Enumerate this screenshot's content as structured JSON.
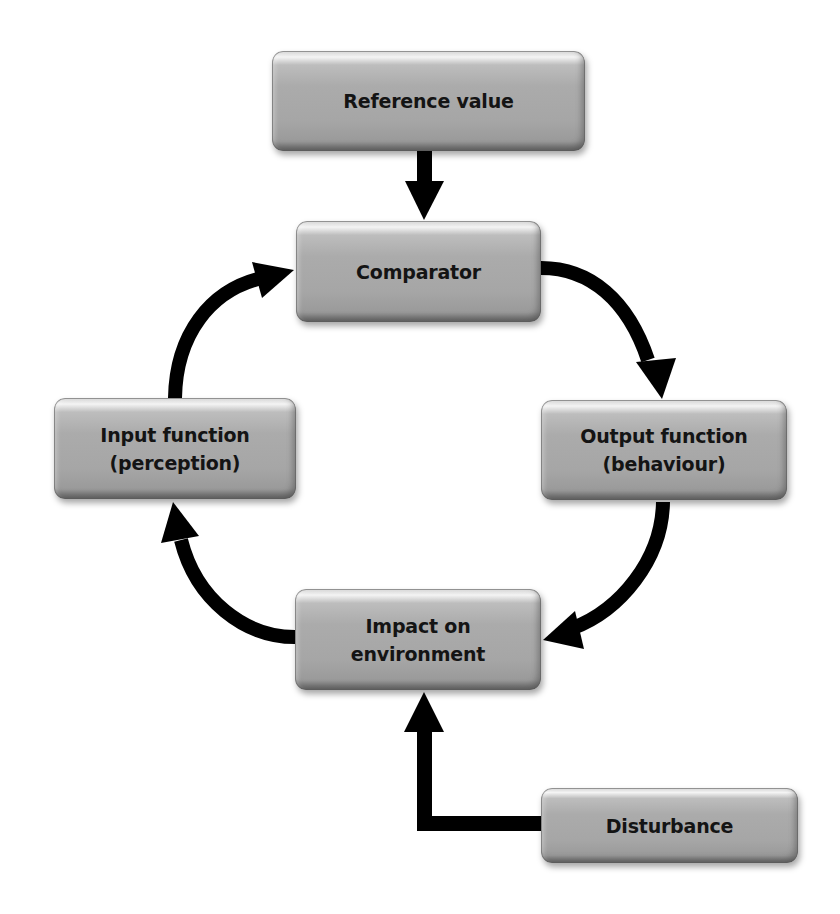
{
  "diagram": {
    "type": "feedback-control-loop",
    "colors": {
      "background": "#ffffff",
      "node_fill": "#a8a8a8",
      "node_text": "#141414",
      "arrow": "#000000"
    },
    "nodes": {
      "reference_value": {
        "label": "Reference value"
      },
      "comparator": {
        "label": "Comparator"
      },
      "output_function": {
        "label": "Output function\n(behaviour)"
      },
      "impact_on_environment": {
        "label": "Impact on\nenvironment"
      },
      "input_function": {
        "label": "Input function\n(perception)"
      },
      "disturbance": {
        "label": "Disturbance"
      }
    },
    "edges": [
      {
        "from": "Reference value",
        "to": "Comparator",
        "style": "straight"
      },
      {
        "from": "Comparator",
        "to": "Output function (behaviour)",
        "style": "curved"
      },
      {
        "from": "Output function (behaviour)",
        "to": "Impact on environment",
        "style": "curved"
      },
      {
        "from": "Impact on environment",
        "to": "Input function (perception)",
        "style": "curved"
      },
      {
        "from": "Input function (perception)",
        "to": "Comparator",
        "style": "curved"
      },
      {
        "from": "Disturbance",
        "to": "Impact on environment",
        "style": "elbow"
      }
    ]
  }
}
